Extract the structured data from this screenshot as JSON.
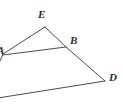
{
  "figure": {
    "type": "geometry-diagram",
    "width": 123,
    "height": 104,
    "background_color": "#ffffff",
    "line_color": "#4a4a52",
    "label_color": "#2b2b30",
    "points": [
      {
        "id": "A",
        "label": "A",
        "x": 3,
        "y": 54,
        "label_x": -3,
        "label_y": 45,
        "clipped": true
      },
      {
        "id": "E",
        "label": "E",
        "x": 45,
        "y": 27,
        "label_x": 38,
        "label_y": 9,
        "clipped": false
      },
      {
        "id": "B",
        "label": "B",
        "x": 66,
        "y": 47,
        "label_x": 70,
        "label_y": 35,
        "clipped": false
      },
      {
        "id": "D",
        "label": "D",
        "x": 105,
        "y": 81,
        "label_x": 109,
        "label_y": 72,
        "clipped": false
      }
    ],
    "segments": [
      {
        "id": "AE",
        "from": "A",
        "to": "E",
        "x1": 3,
        "y1": 54,
        "x2": 45,
        "y2": 27
      },
      {
        "id": "EB",
        "from": "E",
        "to": "B",
        "x1": 45,
        "y1": 27,
        "x2": 66,
        "y2": 47
      },
      {
        "id": "AB",
        "from": "A",
        "to": "B",
        "x1": 3,
        "y1": 55,
        "x2": 66,
        "y2": 47
      },
      {
        "id": "BD",
        "from": "B",
        "to": "D",
        "x1": 66,
        "y1": 47,
        "x2": 105,
        "y2": 81
      },
      {
        "id": "CD",
        "from": "edge-left",
        "to": "D",
        "x1": -2,
        "y1": 98,
        "x2": 105,
        "y2": 81
      },
      {
        "id": "AC",
        "from": "A",
        "to": "edge-left-lower",
        "x1": 3,
        "y1": 54,
        "x2": -4,
        "y2": 70
      }
    ]
  }
}
